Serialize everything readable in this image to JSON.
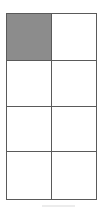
{
  "page": {
    "background_color": "#ffffff",
    "width": 107,
    "height": 213
  },
  "grid": {
    "name": "two-column-four-row-grid",
    "columns": 2,
    "rows": 4,
    "border_color": "#5a5a5a",
    "cell_background": "#ffffff",
    "highlight_color": "#8c8c8c",
    "cells": [
      [
        {
          "text": "",
          "filled": true
        },
        {
          "text": "",
          "filled": false
        }
      ],
      [
        {
          "text": "",
          "filled": false
        },
        {
          "text": "",
          "filled": false
        }
      ],
      [
        {
          "text": "",
          "filled": false
        },
        {
          "text": "",
          "filled": false
        }
      ],
      [
        {
          "text": "",
          "filled": false
        },
        {
          "text": "",
          "filled": false
        }
      ]
    ]
  },
  "footer_rule": {
    "name": "faint-bottom-rule",
    "color": "#ececec"
  }
}
